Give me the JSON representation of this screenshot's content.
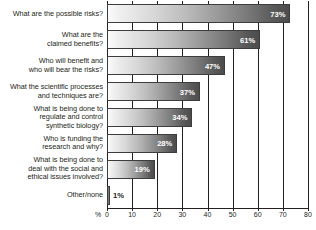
{
  "chart_data": {
    "type": "bar",
    "orientation": "horizontal",
    "title": "",
    "xlabel": "%",
    "ylabel": "",
    "xlim": [
      0,
      80
    ],
    "xticks": [
      0,
      10,
      20,
      30,
      40,
      50,
      60,
      70,
      80
    ],
    "xtick_labels": [
      "0",
      "10",
      "20",
      "30",
      "40",
      "50",
      "60",
      "70",
      "80"
    ],
    "axis_unit_label": "%",
    "grid": true,
    "grid_axis": "x",
    "legend": false,
    "categories": [
      "What are the possible risks?",
      "What are the claimed benefits?",
      "Who will benefit and who will bear the risks?",
      "What the scientific processes and techniques are?",
      "What is being done to regulate and control synthetic biology?",
      "Who is funding the research and why?",
      "What is being done to deal with the social and ethical issues involved?",
      "Other/none"
    ],
    "values": [
      73,
      61,
      47,
      37,
      34,
      28,
      19,
      1
    ],
    "data_labels": [
      "73%",
      "61%",
      "47%",
      "37%",
      "34%",
      "28%",
      "19%",
      "1%"
    ],
    "bar_gradient": {
      "from": "#fbfbfb",
      "to": "#4c4c4c"
    },
    "axis_color": "#231f20",
    "background": "#ffffff"
  },
  "labels": [
    {
      "lines": [
        "What are the possible risks?"
      ]
    },
    {
      "lines": [
        "What are the",
        "claimed benefits?"
      ]
    },
    {
      "lines": [
        "Who will benefit and",
        "who will bear the risks?"
      ]
    },
    {
      "lines": [
        "What the scientific processes",
        "and techniques are?"
      ]
    },
    {
      "lines": [
        "What is being done to",
        "regulate and control",
        "synthetic biology?"
      ]
    },
    {
      "lines": [
        "Who is funding the",
        "research and why?"
      ]
    },
    {
      "lines": [
        "What is being done to",
        "deal with the social and",
        "ethical issues involved?"
      ]
    },
    {
      "lines": [
        "Other/none"
      ]
    }
  ]
}
